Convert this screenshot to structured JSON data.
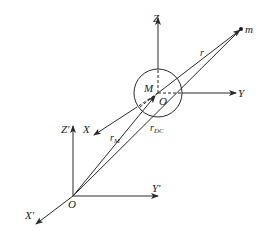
{
  "diagram": {
    "type": "coordinate-frames",
    "stroke_color": "#2a2a2a",
    "background": "#ffffff",
    "global_frame": {
      "origin_label": "O",
      "axes": {
        "x": "X'",
        "y": "Y'",
        "z": "Z'"
      }
    },
    "body_frame": {
      "origin_label": "O",
      "center_mass_label": "M",
      "axes": {
        "x": "X",
        "y": "Y",
        "z": "Z"
      }
    },
    "point_label": "m",
    "vectors": {
      "r": "r",
      "r_M": {
        "base": "r",
        "sub": "M"
      },
      "r_DC": {
        "base": "r",
        "sub": "DC"
      }
    }
  }
}
